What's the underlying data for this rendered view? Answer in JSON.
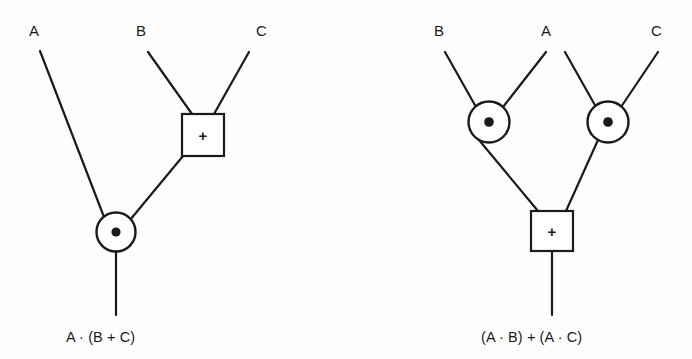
{
  "diagram": {
    "background_color": "#fefefe",
    "line_color": "#1a1a1a",
    "symbols": {
      "and_gate": "circle-with-dot",
      "or_gate": "square-with-plus",
      "and_glyph": "●",
      "or_glyph": "+"
    },
    "left_circuit": {
      "name": "A AND (B OR C)",
      "inputs": [
        {
          "label": "A",
          "x": 35,
          "y": 30
        },
        {
          "label": "B",
          "x": 142,
          "y": 30
        },
        {
          "label": "C",
          "x": 262,
          "y": 30
        }
      ],
      "gates": [
        {
          "name": "or-gate",
          "op": "+",
          "type": "square",
          "cx": 203,
          "cy": 135
        },
        {
          "name": "and-gate",
          "op": "●",
          "type": "circle",
          "cx": 116,
          "cy": 232
        }
      ],
      "output_label": "A · (B + C)",
      "output_x": 70,
      "output_y": 332
    },
    "right_circuit": {
      "name": "(A AND B) OR (A AND C)",
      "inputs": [
        {
          "label": "B",
          "x": 440,
          "y": 30
        },
        {
          "label": "A",
          "x": 547,
          "y": 30
        },
        {
          "label": "C",
          "x": 657,
          "y": 30
        }
      ],
      "gates": [
        {
          "name": "and-gate-left",
          "op": "●",
          "type": "circle",
          "cx": 489,
          "cy": 122
        },
        {
          "name": "and-gate-right",
          "op": "●",
          "type": "circle",
          "cx": 608,
          "cy": 122
        },
        {
          "name": "or-gate",
          "op": "+",
          "type": "square",
          "cx": 552,
          "cy": 231
        }
      ],
      "output_label": "(A · B) + (A · C)",
      "output_x": 485,
      "output_y": 332
    }
  }
}
